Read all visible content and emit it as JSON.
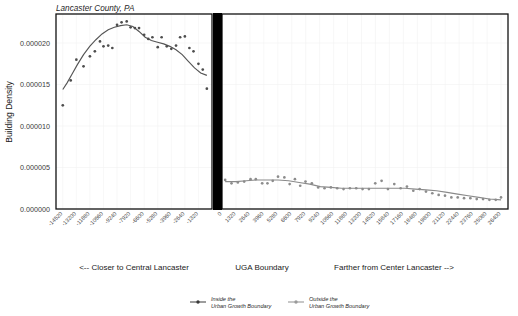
{
  "chart_data": {
    "type": "scatter",
    "title": "Lancaster County, PA",
    "ylabel": "Building Density",
    "xlabel": "",
    "grid": true,
    "legend_position": "bottom",
    "ylim": [
      0.0,
      2.35e-05
    ],
    "yticks": [
      "0.000000",
      "0.000005",
      "0.000010",
      "0.000015",
      "0.000020"
    ],
    "ytick_values": [
      0.0,
      5e-06,
      1e-05,
      1.5e-05,
      2e-05
    ],
    "panels": [
      {
        "name": "inside",
        "legend": "Inside the Urban Growth Boundary",
        "footer": "<-- Closer to Central Lancaster",
        "xlim": [
          -15180,
          0
        ],
        "xticks": [
          "-14520",
          "-13200",
          "-11880",
          "-10560",
          "-9240",
          "-7920",
          "-6600",
          "-5280",
          "-3960",
          "-2640",
          "-1320"
        ],
        "xtick_values": [
          -14520,
          -13200,
          -11880,
          -10560,
          -9240,
          -7920,
          -6600,
          -5280,
          -3960,
          -2640,
          -1320
        ],
        "x": [
          -14520,
          -13750,
          -13200,
          -12500,
          -11880,
          -11400,
          -10900,
          -10560,
          -10100,
          -9700,
          -9240,
          -8800,
          -8300,
          -7920,
          -7500,
          -7100,
          -6600,
          -6200,
          -5800,
          -5280,
          -4900,
          -4400,
          -3960,
          -3500,
          -3100,
          -2640,
          -2200,
          -1800,
          -1320,
          -900,
          -500
        ],
        "y": [
          1.25e-05,
          1.55e-05,
          1.8e-05,
          1.72e-05,
          1.84e-05,
          1.9e-05,
          2.02e-05,
          1.96e-05,
          1.97e-05,
          1.94e-05,
          2.22e-05,
          2.25e-05,
          2.26e-05,
          2.19e-05,
          2.18e-05,
          2.18e-05,
          2.1e-05,
          2.05e-05,
          2.07e-05,
          1.95e-05,
          2.07e-05,
          1.96e-05,
          1.93e-05,
          1.97e-05,
          2.07e-05,
          2.08e-05,
          1.94e-05,
          1.9e-05,
          1.75e-05,
          1.68e-05,
          1.45e-05
        ],
        "trend_x": [
          -14520,
          -14100,
          -13600,
          -13100,
          -12500,
          -11900,
          -11300,
          -10700,
          -10100,
          -9500,
          -8900,
          -8300,
          -7700,
          -7100,
          -6500,
          -5900,
          -5300,
          -4700,
          -4100,
          -3500,
          -2900,
          -2300,
          -1700,
          -1100,
          -500
        ],
        "trend_y": [
          1.44e-05,
          1.52e-05,
          1.63e-05,
          1.74e-05,
          1.86e-05,
          1.96e-05,
          2.04e-05,
          2.11e-05,
          2.16e-05,
          2.19e-05,
          2.21e-05,
          2.22e-05,
          2.2e-05,
          2.14e-05,
          2.07e-05,
          2.03e-05,
          2.01e-05,
          1.99e-05,
          1.96e-05,
          1.92e-05,
          1.86e-05,
          1.78e-05,
          1.7e-05,
          1.64e-05,
          1.61e-05
        ]
      },
      {
        "name": "outside",
        "legend": "Outside the Urban Growth Boundary",
        "footer": "Farther from Center Lancaster -->",
        "xlim": [
          0,
          27060
        ],
        "xticks": [
          "0",
          "1320",
          "2640",
          "3960",
          "5280",
          "6600",
          "7920",
          "9240",
          "10560",
          "11880",
          "13200",
          "14520",
          "15840",
          "17160",
          "18480",
          "19800",
          "21120",
          "22440",
          "23760",
          "25080",
          "26400"
        ],
        "xtick_values": [
          0,
          1320,
          2640,
          3960,
          5280,
          6600,
          7920,
          9240,
          10560,
          11880,
          13200,
          14520,
          15840,
          17160,
          18480,
          19800,
          21120,
          22440,
          23760,
          25080,
          26400
        ],
        "x": [
          300,
          900,
          1500,
          2100,
          2700,
          3200,
          3800,
          4300,
          4800,
          5300,
          5900,
          6400,
          6900,
          7400,
          7900,
          8500,
          9100,
          9700,
          10300,
          10900,
          11500,
          12100,
          12700,
          13300,
          13900,
          14500,
          15100,
          15700,
          16300,
          16900,
          17500,
          18100,
          18700,
          19300,
          19900,
          20500,
          21100,
          21700,
          22300,
          22900,
          23500,
          24100,
          24700,
          25300,
          25900,
          26400
        ],
        "y": [
          3.5e-06,
          3.1e-06,
          3.2e-06,
          3.3e-06,
          3.6e-06,
          3.6e-06,
          3.1e-06,
          3.1e-06,
          3.4e-06,
          3.9e-06,
          3.8e-06,
          3e-06,
          3.6e-06,
          2.8e-06,
          3.3e-06,
          3.1e-06,
          2.6e-06,
          2.5e-06,
          2.6e-06,
          2.5e-06,
          2.4e-06,
          2.5e-06,
          2.5e-06,
          2.4e-06,
          2.4e-06,
          3.1e-06,
          3.4e-06,
          2.4e-06,
          3e-06,
          2.5e-06,
          2.7e-06,
          2.2e-06,
          2.4e-06,
          2.1e-06,
          1.9e-06,
          1.7e-06,
          1.6e-06,
          1.4e-06,
          1.4e-06,
          1.3e-06,
          1.3e-06,
          1.2e-06,
          1.2e-06,
          1.1e-06,
          1.1e-06,
          1.4e-06
        ],
        "trend_x": [
          300,
          1300,
          2300,
          3300,
          4300,
          5300,
          6300,
          7300,
          8300,
          9300,
          10300,
          11300,
          12300,
          13300,
          14300,
          15300,
          16300,
          17300,
          18300,
          19300,
          20300,
          21300,
          22300,
          23300,
          24300,
          25300,
          26400
        ],
        "trend_y": [
          3.3e-06,
          3.3e-06,
          3.4e-06,
          3.5e-06,
          3.5e-06,
          3.5e-06,
          3.4e-06,
          3.2e-06,
          3e-06,
          2.7e-06,
          2.6e-06,
          2.5e-06,
          2.5e-06,
          2.5e-06,
          2.5e-06,
          2.5e-06,
          2.5e-06,
          2.5e-06,
          2.4e-06,
          2.3e-06,
          2.2e-06,
          2e-06,
          1.8e-06,
          1.6e-06,
          1.4e-06,
          1.2e-06,
          1.1e-06
        ]
      }
    ]
  },
  "title": "Lancaster County, PA",
  "axis": {
    "y_label": "Building Density"
  },
  "footer": {
    "left": "<-- Closer to Central Lancaster",
    "center": "UGA Boundary",
    "right": "Farther from Center Lancaster -->"
  },
  "legend": {
    "items": [
      {
        "line1": "Inside the",
        "line2": "Urban Growth Boundary",
        "color": "#4d4d4d"
      },
      {
        "line1": "Outside the",
        "line2": "Urban Growth Boundary",
        "color": "#9a9a9a"
      }
    ]
  },
  "colors": {
    "inside_point": "#4d4d4d",
    "outside_point": "#8c8c8c",
    "inside_line": "#555555",
    "outside_line": "#8a8a8a",
    "frame": "#111111",
    "divider": "#000000",
    "grid": "#f2f2f2"
  }
}
